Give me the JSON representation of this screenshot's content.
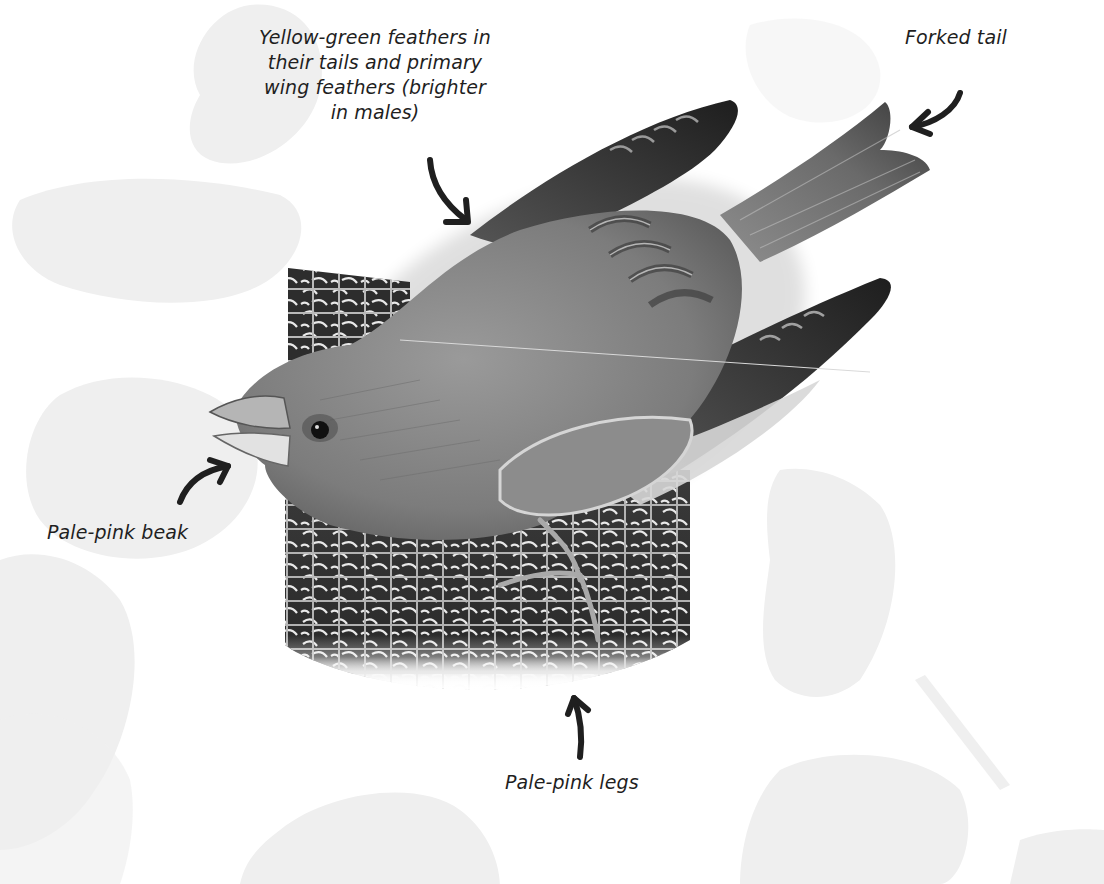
{
  "figure": {
    "style": "grayscale field-guide illustration with pale leaf silhouettes in background",
    "colors": {
      "background": "#ffffff",
      "leaf_silhouette": "#efefef",
      "label_text": "#1f1f1f",
      "arrow": "#1f1f1f",
      "bird_body": "#8a8a8a",
      "wing_dark": "#2e2e2e",
      "feeder_dark": "#2a2a2a"
    }
  },
  "callouts": {
    "wing": {
      "lines": [
        "Yellow-green feathers in",
        "their tails and primary",
        "wing feathers (brighter",
        "in males)"
      ],
      "arrow_icon": "curved-arrow-down-right-icon"
    },
    "tail": {
      "lines": [
        "Forked tail"
      ],
      "arrow_icon": "curved-arrow-left-icon"
    },
    "beak": {
      "lines": [
        "Pale-pink beak"
      ],
      "arrow_icon": "curved-arrow-up-right-icon"
    },
    "legs": {
      "lines": [
        "Pale-pink legs"
      ],
      "arrow_icon": "curved-arrow-up-icon"
    }
  }
}
